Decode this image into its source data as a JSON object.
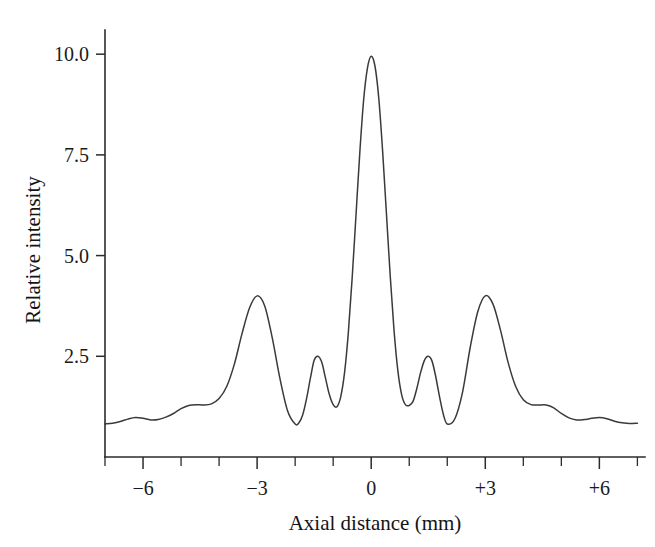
{
  "figure": {
    "background_color": "#ffffff",
    "line_color": "#3a3a3a",
    "axis_color": "#2b2b2b"
  },
  "chart_data": {
    "type": "line",
    "title": "",
    "xlabel": "Axial distance (mm)",
    "ylabel": "Relative intensity",
    "xlim": [
      -7.0,
      7.2
    ],
    "ylim": [
      0.0,
      10.6
    ],
    "grid": false,
    "legend": null,
    "x_tick_labels": [
      "−6",
      "−3",
      "0",
      "+3",
      "+6"
    ],
    "x_tick_values": [
      -6,
      -3,
      0,
      3,
      6
    ],
    "x_minor_tick_values": [
      -7,
      -6,
      -5,
      -4,
      -3,
      -2,
      -1,
      0,
      1,
      2,
      3,
      4,
      5,
      6,
      7
    ],
    "y_tick_labels": [
      "2.5",
      "5.0",
      "7.5",
      "10.0"
    ],
    "y_tick_values": [
      2.5,
      5.0,
      7.5,
      10.0
    ],
    "series": [
      {
        "name": "Relative intensity",
        "x": [
          -7.0,
          -6.8,
          -6.6,
          -6.4,
          -6.2,
          -6.0,
          -5.8,
          -5.6,
          -5.4,
          -5.2,
          -5.0,
          -4.8,
          -4.6,
          -4.4,
          -4.2,
          -4.0,
          -3.8,
          -3.6,
          -3.4,
          -3.2,
          -3.0,
          -2.8,
          -2.6,
          -2.4,
          -2.2,
          -2.0,
          -1.9,
          -1.8,
          -1.7,
          -1.6,
          -1.5,
          -1.4,
          -1.3,
          -1.2,
          -1.1,
          -1.0,
          -0.9,
          -0.8,
          -0.7,
          -0.6,
          -0.5,
          -0.4,
          -0.3,
          -0.2,
          -0.1,
          0.0,
          0.1,
          0.2,
          0.3,
          0.4,
          0.5,
          0.6,
          0.7,
          0.8,
          0.9,
          1.0,
          1.1,
          1.2,
          1.3,
          1.4,
          1.5,
          1.6,
          1.7,
          1.8,
          1.9,
          2.0,
          2.2,
          2.4,
          2.6,
          2.8,
          3.0,
          3.2,
          3.4,
          3.6,
          3.8,
          4.0,
          4.2,
          4.4,
          4.6,
          4.8,
          5.0,
          5.2,
          5.4,
          5.6,
          5.8,
          6.0,
          6.2,
          6.4,
          6.6,
          6.8,
          7.0
        ],
        "y": [
          0.82,
          0.84,
          0.88,
          0.94,
          0.98,
          0.96,
          0.92,
          0.93,
          0.99,
          1.08,
          1.2,
          1.28,
          1.3,
          1.29,
          1.32,
          1.45,
          1.75,
          2.3,
          3.05,
          3.7,
          4.0,
          3.75,
          2.95,
          1.95,
          1.15,
          0.82,
          0.85,
          1.05,
          1.45,
          1.95,
          2.4,
          2.5,
          2.35,
          1.95,
          1.55,
          1.3,
          1.25,
          1.5,
          2.1,
          3.1,
          4.45,
          6.0,
          7.55,
          8.85,
          9.65,
          9.95,
          9.7,
          8.9,
          7.6,
          6.05,
          4.5,
          3.15,
          2.15,
          1.55,
          1.3,
          1.28,
          1.38,
          1.7,
          2.1,
          2.4,
          2.5,
          2.38,
          1.98,
          1.48,
          1.05,
          0.82,
          0.95,
          1.6,
          2.7,
          3.6,
          4.0,
          3.8,
          3.15,
          2.35,
          1.75,
          1.42,
          1.3,
          1.29,
          1.29,
          1.22,
          1.08,
          0.97,
          0.92,
          0.93,
          0.96,
          0.98,
          0.95,
          0.89,
          0.85,
          0.83,
          0.84
        ]
      }
    ]
  }
}
